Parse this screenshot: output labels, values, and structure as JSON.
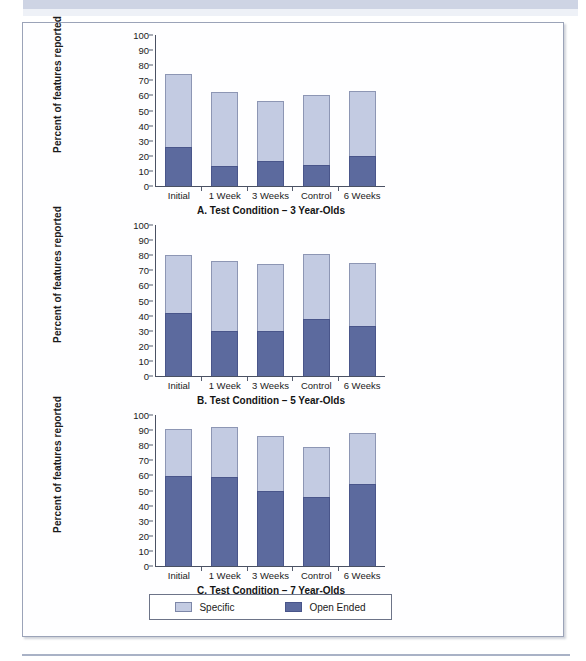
{
  "figure": {
    "legend": {
      "items": [
        {
          "label": "Specific",
          "color": "#c3cbe2",
          "icon": "square-swatch-icon"
        },
        {
          "label": "Open Ended",
          "color": "#5c6a9e",
          "icon": "square-swatch-icon"
        }
      ]
    }
  },
  "chart_data": [
    {
      "type": "bar",
      "stacked": true,
      "panel": "A",
      "title": "A. Test Condition – 3 Year-Olds",
      "xlabel": "",
      "ylabel": "Percent of features reported",
      "categories": [
        "Initial",
        "1 Week",
        "3 Weeks",
        "Control",
        "6 Weeks"
      ],
      "ylim": [
        0,
        100
      ],
      "yticks": [
        0,
        10,
        20,
        30,
        40,
        50,
        60,
        70,
        80,
        90,
        100
      ],
      "grid": false,
      "legend_position": "below-figure",
      "series": [
        {
          "name": "Open Ended",
          "color": "#5c6a9e",
          "values": [
            26,
            13,
            16.5,
            14,
            20
          ]
        },
        {
          "name": "Specific",
          "color": "#c3cbe2",
          "values": [
            48,
            49.5,
            39.5,
            46,
            43
          ]
        }
      ],
      "totals": [
        74,
        62.5,
        56,
        60,
        63
      ]
    },
    {
      "type": "bar",
      "stacked": true,
      "panel": "B",
      "title": "B. Test Condition – 5 Year-Olds",
      "xlabel": "",
      "ylabel": "Percent of features reported",
      "categories": [
        "Initial",
        "1 Week",
        "3 Weeks",
        "Control",
        "6 Weeks"
      ],
      "ylim": [
        0,
        100
      ],
      "yticks": [
        0,
        10,
        20,
        30,
        40,
        50,
        60,
        70,
        80,
        90,
        100
      ],
      "grid": false,
      "legend_position": "below-figure",
      "series": [
        {
          "name": "Open Ended",
          "color": "#5c6a9e",
          "values": [
            41.5,
            30,
            30,
            38,
            33
          ]
        },
        {
          "name": "Specific",
          "color": "#c3cbe2",
          "values": [
            38.5,
            46,
            44,
            42.5,
            42
          ]
        }
      ],
      "totals": [
        80,
        76,
        74,
        80.5,
        75
      ]
    },
    {
      "type": "bar",
      "stacked": true,
      "panel": "C",
      "title": "C. Test Condition – 7 Year-Olds",
      "xlabel": "",
      "ylabel": "Percent of features reported",
      "categories": [
        "Initial",
        "1 Week",
        "3 Weeks",
        "Control",
        "6 Weeks"
      ],
      "ylim": [
        0,
        100
      ],
      "yticks": [
        0,
        10,
        20,
        30,
        40,
        50,
        60,
        70,
        80,
        90,
        100
      ],
      "grid": false,
      "legend_position": "below-figure",
      "series": [
        {
          "name": "Open Ended",
          "color": "#5c6a9e",
          "values": [
            59.5,
            59,
            50,
            45.5,
            54
          ]
        },
        {
          "name": "Specific",
          "color": "#c3cbe2",
          "values": [
            31,
            33,
            36,
            33.5,
            34
          ]
        }
      ],
      "totals": [
        90.5,
        92,
        86,
        79,
        88
      ]
    }
  ]
}
